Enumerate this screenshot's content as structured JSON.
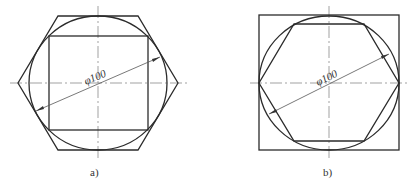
{
  "figures": [
    {
      "id": "a",
      "caption": "a)",
      "dimension_label": "φ100",
      "description": "Square inscribed in circle, circle inscribed in hexagon (horizontal vertex orientation)"
    },
    {
      "id": "b",
      "caption": "b)",
      "dimension_label": "φ100",
      "description": "Hexagon inscribed in circle, circle inscribed in square"
    }
  ],
  "colors": {
    "stroke": "#2b2b2b",
    "centerline": "#7a7a7a",
    "background": "#ffffff"
  }
}
